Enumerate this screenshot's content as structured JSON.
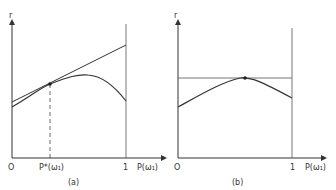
{
  "panels": [
    {
      "id": "a",
      "caption": "(a)",
      "y_axis_label": "r",
      "x_axis_label": "P(ω₁)",
      "origin_label": "O",
      "x_tick_one": "1",
      "marked_point_label": "P*(ω₁)",
      "description": "Concave curve with tangent line touching at P*; dashed vertical drop from tangent point to x-axis"
    },
    {
      "id": "b",
      "caption": "(b)",
      "y_axis_label": "r",
      "x_axis_label": "P(ω₁)",
      "origin_label": "O",
      "x_tick_one": "1",
      "description": "Concave curve with horizontal tangent line at its maximum"
    }
  ],
  "colors": {
    "line": "#333333",
    "tangent_b": "#666666"
  }
}
